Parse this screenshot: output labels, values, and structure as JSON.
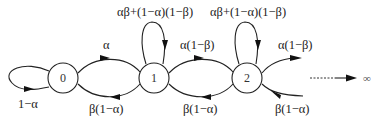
{
  "diagram": {
    "type": "markov-chain",
    "nodes": [
      {
        "id": "0",
        "label": "0"
      },
      {
        "id": "1",
        "label": "1"
      },
      {
        "id": "2",
        "label": "2"
      }
    ],
    "edges": [
      {
        "from": "0",
        "to": "0",
        "label": "1−α"
      },
      {
        "from": "0",
        "to": "1",
        "label": "α"
      },
      {
        "from": "1",
        "to": "0",
        "label": "β(1−α)"
      },
      {
        "from": "1",
        "to": "1",
        "label": "αβ+(1−α)(1−β)"
      },
      {
        "from": "1",
        "to": "2",
        "label": "α(1−β)"
      },
      {
        "from": "2",
        "to": "1",
        "label": "β(1−α)"
      },
      {
        "from": "2",
        "to": "2",
        "label": "αβ+(1−α)(1−β)"
      },
      {
        "from": "2",
        "to": "3",
        "label": "α(1−β)"
      },
      {
        "from": "3",
        "to": "2",
        "label": "β(1−α)"
      }
    ],
    "infinity_label": "∞"
  }
}
